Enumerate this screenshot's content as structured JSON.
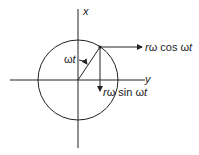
{
  "diagram": {
    "axes": {
      "x_label": "x",
      "y_label": "y"
    },
    "angle_label": {
      "omega": "ω",
      "t": "t"
    },
    "cos_component": {
      "prefix_r": "r",
      "omega": "ω",
      "func": " cos ",
      "arg_omega": "ω",
      "arg_t": "t"
    },
    "sin_component": {
      "prefix_r": "r",
      "omega": "ω",
      "func": " sin ",
      "arg_omega": "ω",
      "arg_t": "t"
    },
    "colors": {
      "stroke": "#222222",
      "background": "#ffffff"
    }
  }
}
